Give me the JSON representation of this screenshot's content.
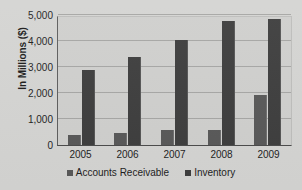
{
  "chart_data": {
    "type": "bar",
    "title": "",
    "xlabel": "",
    "ylabel": "In Millions ($)",
    "categories": [
      "2005",
      "2006",
      "2007",
      "2008",
      "2009"
    ],
    "series": [
      {
        "name": "Accounts Receivable",
        "color": "#585858",
        "values": [
          400,
          470,
          580,
          590,
          1930
        ]
      },
      {
        "name": "Inventory",
        "color": "#3d3d3d",
        "values": [
          2870,
          3370,
          4050,
          4780,
          4830
        ]
      }
    ],
    "ylim": [
      0,
      5000
    ],
    "y_ticks": [
      "0",
      "1,000",
      "2,000",
      "3,000",
      "4,000",
      "5,000"
    ],
    "y_tick_values": [
      0,
      1000,
      2000,
      3000,
      4000,
      5000
    ],
    "grid": true,
    "legend_position": "bottom",
    "plot_background": "#cfcfcd",
    "page_background": "#d4d4d2"
  },
  "legend": {
    "entries": [
      {
        "label": "Accounts Receivable"
      },
      {
        "label": "Inventory"
      }
    ]
  }
}
